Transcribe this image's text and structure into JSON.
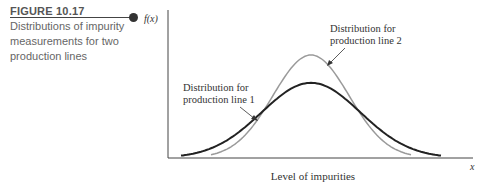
{
  "figure": {
    "label": "FIGURE 10.17",
    "caption": "Distributions of impurity measurements for two production lines"
  },
  "chart_data": {
    "type": "line",
    "title": "Distributions of impurity measurements for two production lines",
    "xlabel": "Level of impurities",
    "ylabel": "f(x)",
    "x_axis_symbol": "x",
    "grid": false,
    "ticks": false,
    "series": [
      {
        "name": "Distribution for production line 1",
        "shape": "normal",
        "mean": 0,
        "relative_sd": 1.3,
        "relative_peak": 0.73,
        "color": "#222222"
      },
      {
        "name": "Distribution for production line 2",
        "shape": "normal",
        "mean": 0,
        "relative_sd": 1.0,
        "relative_peak": 1.0,
        "color": "#9a9a9a"
      }
    ],
    "annotations": [
      {
        "text": "Distribution for production line 2",
        "points_to": "line 2 curve, right shoulder"
      },
      {
        "text": "Distribution for production line 1",
        "points_to": "line 1 curve, left shoulder"
      }
    ]
  },
  "labels": {
    "fx": "f(x)",
    "x": "x",
    "xlabel": "Level of impurities",
    "ann2_l1": "Distribution for",
    "ann2_l2": "production line 2",
    "ann1_l1": "Distribution for",
    "ann1_l2": "production line 1"
  }
}
